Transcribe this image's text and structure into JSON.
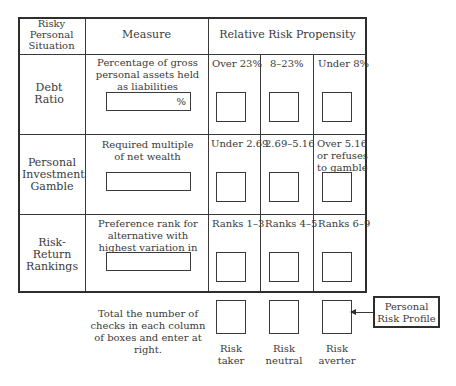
{
  "table": {
    "headers": {
      "situation": "Risky Personal Situation",
      "measure": "Measure",
      "propensity": "Relative Risk Propensity"
    },
    "rows": [
      {
        "situation": "Debt Ratio",
        "measure": "Percentage of gross personal assets held as liabilities",
        "input_value": "",
        "input_suffix": "%",
        "ranges": [
          "Over 23%",
          "8–23%",
          "Under 8%"
        ]
      },
      {
        "situation": "Personal Investment Gamble",
        "measure": "Required multiple of net wealth",
        "input_value": "",
        "ranges": [
          "Under 2.69",
          "2.69–5.16",
          "Over 5.16 or refuses to gamble"
        ]
      },
      {
        "situation": "Risk-Return Rankings",
        "measure": "Preference rank for alternative with highest variation in returns",
        "input_value": "",
        "ranges": [
          "Ranks 1–3",
          "Ranks 4–5",
          "Ranks 6–9"
        ]
      }
    ]
  },
  "totals": {
    "instruction": "Total the number of checks in each column of boxes and enter at right.",
    "labels": [
      "Risk taker",
      "Risk neutral",
      "Risk averter"
    ]
  },
  "profile": {
    "label": "Personal Risk Profile"
  }
}
